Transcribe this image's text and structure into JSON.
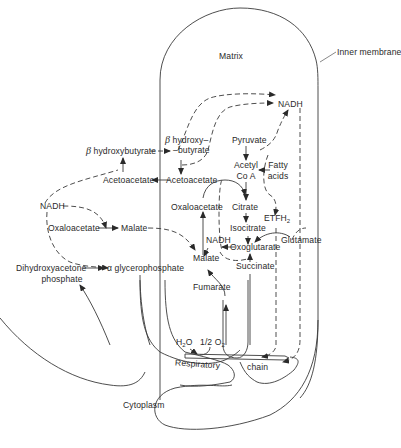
{
  "diagram": {
    "regions": {
      "matrix": "Matrix",
      "inner_membrane": "Inner membrane",
      "cytoplasm": "Cytoplasm"
    },
    "cytoplasm_metabolites": {
      "beta_hydroxybutyrate_greek": "β",
      "beta_hydroxybutyrate": "hydroxybutyrate",
      "acetoacetate": "Acetoacetate",
      "nadh": "NADH",
      "oxaloacetate": "Oxaloacetate",
      "malate": "Malate",
      "dihydroxyacetone_line1": "Dihydroxyacetone",
      "dihydroxyacetone_line2": "phosphate",
      "alpha_glycerophosphate_greek": "α",
      "alpha_glycerophosphate": "glycerophosphate"
    },
    "matrix_metabolites": {
      "beta_hydroxy_greek": "β",
      "beta_hydroxy_line1": "hydroxy–",
      "beta_hydroxy_line2": "–butyrate",
      "acetoacetate": "Acetoacetate",
      "nadh_top": "NADH",
      "pyruvate": "Pyruvate",
      "acetyl_line1": "Acetyl",
      "acetyl_line2": "Co A",
      "fatty_line1": "Fatty",
      "fatty_line2": "acids",
      "oxaloacetate": "Oxaloacetate",
      "citrate": "Citrate",
      "etfh2_main": "ETFH",
      "etfh2_sub": "2",
      "isocitrate": "Isocitrate",
      "nadh_mid": "NADH",
      "oxoglutarate": "Oxoglutarate",
      "glutamate": "Glutamate",
      "malate": "Malate",
      "succinate": "Succinate",
      "fumarate": "Fumarate"
    },
    "respiratory_chain": {
      "water_main": "H",
      "water_sub": "2",
      "water_end": "O",
      "oxygen_main": "1/2 O",
      "oxygen_sub": "2",
      "label_left": "Respiratory",
      "label_right": "chain"
    },
    "colors": {
      "line": "#3a3a3a",
      "text": "#2a2a2a",
      "background": "#ffffff"
    }
  }
}
